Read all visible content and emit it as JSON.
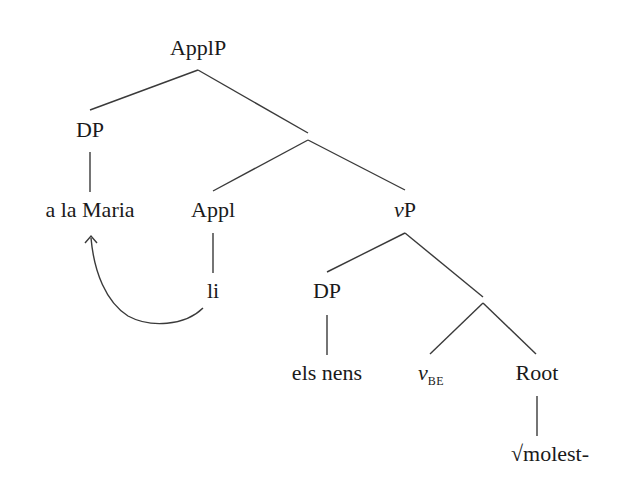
{
  "diagram": {
    "type": "syntax-tree",
    "nodes": {
      "root": "ApplP",
      "dp1": "DP",
      "dp1_leaf": "a la Maria",
      "appl": "Appl",
      "appl_leaf": "li",
      "vp_v": "v",
      "vp_p": "P",
      "dp2": "DP",
      "dp2_leaf": "els nens",
      "vbe_v": "v",
      "vbe_sub": "BE",
      "rootnode": "Root",
      "root_leaf": "√molest-"
    },
    "edges": [
      [
        "ApplP",
        "DP"
      ],
      [
        "ApplP",
        "Appl'"
      ],
      [
        "DP",
        "a la Maria"
      ],
      [
        "Appl'",
        "Appl"
      ],
      [
        "Appl'",
        "vP"
      ],
      [
        "Appl",
        "li"
      ],
      [
        "vP",
        "DP"
      ],
      [
        "vP",
        "v'"
      ],
      [
        "DP",
        "els nens"
      ],
      [
        "v'",
        "vBE"
      ],
      [
        "v'",
        "Root"
      ],
      [
        "Root",
        "√molest-"
      ]
    ],
    "movement_arrow": {
      "from": "li",
      "to": "a la Maria"
    },
    "line_color": "#3a3a3a"
  }
}
